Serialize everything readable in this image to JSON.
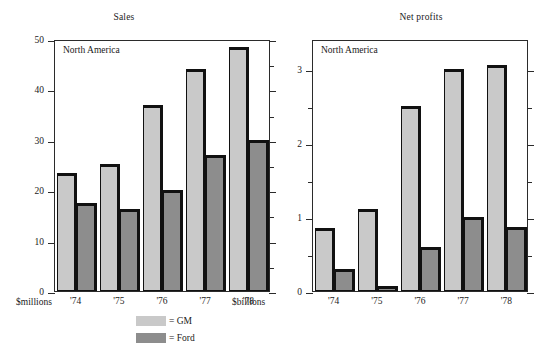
{
  "figure": {
    "legend": {
      "entries": [
        {
          "key": "gm",
          "swatch_color": "#c9c9c9",
          "label": "= GM"
        },
        {
          "key": "ford",
          "swatch_color": "#8d8d8d",
          "label": "= Ford"
        }
      ]
    }
  },
  "chart_data": [
    {
      "type": "bar",
      "title": "Sales",
      "annotation": "North America",
      "xlabel": "",
      "ylabel": "",
      "unit_label": "$millions",
      "categories": [
        "'74",
        "'75",
        "'76",
        "'77",
        "'78"
      ],
      "series": [
        {
          "name": "GM",
          "color": "#c9c9c9",
          "values": [
            23.5,
            25.2,
            37.0,
            44.0,
            48.5
          ]
        },
        {
          "name": "Ford",
          "color": "#8d8d8d",
          "values": [
            17.5,
            16.2,
            20.0,
            27.0,
            30.0
          ]
        }
      ],
      "ylim": [
        0,
        50
      ],
      "yticks": [
        0,
        10,
        20,
        30,
        40,
        50
      ],
      "ytick_labels": [
        "0",
        "10",
        "20",
        "30",
        "40",
        "50"
      ],
      "yminor_ticks": [
        5,
        15,
        25,
        35,
        45
      ],
      "grid": false,
      "legend_position": "bottom-center"
    },
    {
      "type": "bar",
      "title": "Net profits",
      "annotation": "North America",
      "xlabel": "",
      "ylabel": "",
      "unit_label": "$billions",
      "categories": [
        "'74",
        "'75",
        "'76",
        "'77",
        "'78"
      ],
      "series": [
        {
          "name": "GM",
          "color": "#c9c9c9",
          "values": [
            0.85,
            1.1,
            2.5,
            3.0,
            3.05
          ]
        },
        {
          "name": "Ford",
          "color": "#8d8d8d",
          "values": [
            0.3,
            0.07,
            0.6,
            1.0,
            0.87
          ]
        }
      ],
      "ylim": [
        0,
        3.4
      ],
      "yticks": [
        0,
        1,
        2,
        3
      ],
      "ytick_labels": [
        "0",
        "1",
        "2",
        "3"
      ],
      "yminor_ticks": [
        0.5,
        1.5,
        2.5
      ],
      "grid": false,
      "legend_position": "bottom-center"
    }
  ]
}
